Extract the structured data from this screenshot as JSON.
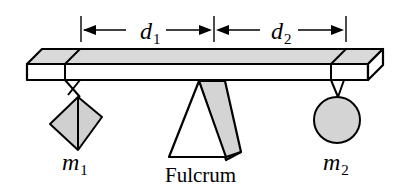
{
  "diagram": {
    "type": "lever-fulcrum",
    "labels": {
      "d1": "d",
      "d1_sub": "1",
      "d2": "d",
      "d2_sub": "2",
      "m1": "m",
      "m1_sub": "1",
      "m2": "m",
      "m2_sub": "2",
      "fulcrum": "Fulcrum"
    },
    "colors": {
      "stroke": "#000000",
      "fill_gray": "#d4d4d4",
      "background": "#ffffff"
    }
  }
}
